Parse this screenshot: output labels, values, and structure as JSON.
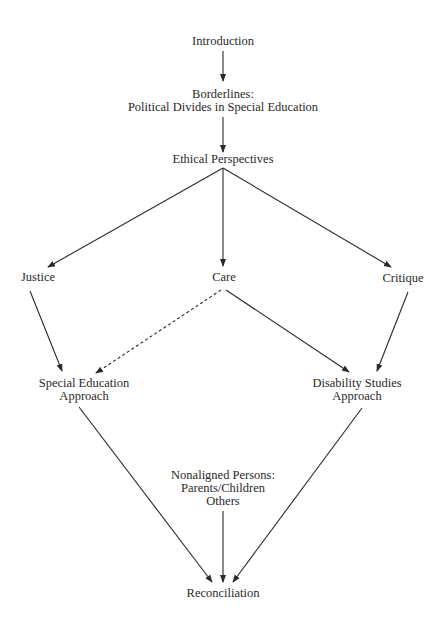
{
  "diagram": {
    "type": "flowchart",
    "nodes": {
      "introduction": {
        "lines": [
          "Introduction"
        ]
      },
      "borderlines": {
        "lines": [
          "Borderlines:",
          "Political Divides in Special Education"
        ]
      },
      "ethical": {
        "lines": [
          "Ethical Perspectives"
        ]
      },
      "justice": {
        "lines": [
          "Justice"
        ]
      },
      "care": {
        "lines": [
          "Care"
        ]
      },
      "critique": {
        "lines": [
          "Critique"
        ]
      },
      "special_ed": {
        "lines": [
          "Special Education",
          "Approach"
        ]
      },
      "disability": {
        "lines": [
          "Disability Studies",
          "Approach"
        ]
      },
      "nonaligned": {
        "lines": [
          "Nonaligned Persons:",
          "Parents/Children",
          "Others"
        ]
      },
      "reconciliation": {
        "lines": [
          "Reconciliation"
        ]
      }
    },
    "edges": [
      {
        "from": "Introduction",
        "to": "Borderlines",
        "style": "solid"
      },
      {
        "from": "Borderlines",
        "to": "Ethical Perspectives",
        "style": "solid"
      },
      {
        "from": "Ethical Perspectives",
        "to": "Justice",
        "style": "solid"
      },
      {
        "from": "Ethical Perspectives",
        "to": "Care",
        "style": "solid"
      },
      {
        "from": "Ethical Perspectives",
        "to": "Critique",
        "style": "solid"
      },
      {
        "from": "Justice",
        "to": "Special Education Approach",
        "style": "solid"
      },
      {
        "from": "Care",
        "to": "Special Education Approach",
        "style": "dashed"
      },
      {
        "from": "Care",
        "to": "Disability Studies Approach",
        "style": "solid"
      },
      {
        "from": "Critique",
        "to": "Disability Studies Approach",
        "style": "solid"
      },
      {
        "from": "Special Education Approach",
        "to": "Reconciliation",
        "style": "solid"
      },
      {
        "from": "Nonaligned Persons",
        "to": "Reconciliation",
        "style": "solid"
      },
      {
        "from": "Disability Studies Approach",
        "to": "Reconciliation",
        "style": "solid"
      }
    ],
    "colors": {
      "line": "#2a2a2a",
      "text": "#2a2a2a",
      "background": "#ffffff"
    }
  }
}
